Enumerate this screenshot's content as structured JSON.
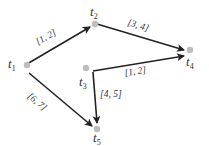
{
  "diagram": {
    "type": "directed-graph",
    "colors": {
      "edge": "#222222",
      "node": "#bdbdbd",
      "text": "#333333"
    },
    "nodes": [
      {
        "id": "t1",
        "base": "t",
        "sub": "1",
        "x": 27,
        "y": 64
      },
      {
        "id": "t2",
        "base": "t",
        "sub": "2",
        "x": 95,
        "y": 24
      },
      {
        "id": "t3",
        "base": "t",
        "sub": "3",
        "x": 86,
        "y": 68
      },
      {
        "id": "t4",
        "base": "t",
        "sub": "4",
        "x": 190,
        "y": 49
      },
      {
        "id": "t5",
        "base": "t",
        "sub": "5",
        "x": 97,
        "y": 129
      }
    ],
    "edges": [
      {
        "from": "t1",
        "to": "t2",
        "label": "[1, 2]"
      },
      {
        "from": "t2",
        "to": "t4",
        "label": "[3, 4]"
      },
      {
        "from": "t3",
        "to": "t4",
        "label": "[1, 2]"
      },
      {
        "from": "t3",
        "to": "t5",
        "label": "[4, 5]"
      },
      {
        "from": "t1",
        "to": "t5",
        "label": "[6, 7]"
      }
    ]
  }
}
